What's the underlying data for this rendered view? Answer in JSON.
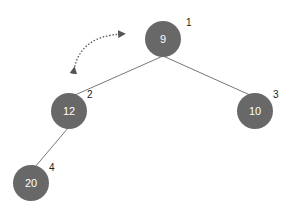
{
  "diagram": {
    "type": "binary-tree",
    "colors": {
      "node_fill": "#686868",
      "node_text": "#ffffff",
      "edge": "#777777",
      "index_text": "#222222",
      "arrow": "#555555"
    },
    "nodes": [
      {
        "value": "9",
        "index": "1",
        "cx": 163,
        "cy": 39
      },
      {
        "value": "12",
        "index": "2",
        "cx": 69,
        "cy": 111
      },
      {
        "value": "10",
        "index": "3",
        "cx": 255,
        "cy": 111
      },
      {
        "value": "20",
        "index": "4",
        "cx": 31,
        "cy": 183
      }
    ],
    "edges": [
      {
        "from": "9",
        "to": "12"
      },
      {
        "from": "9",
        "to": "10"
      },
      {
        "from": "12",
        "to": "20"
      }
    ],
    "swap_arrow": {
      "style": "dotted-curved-double-headed",
      "between": [
        "9",
        "12"
      ]
    }
  }
}
